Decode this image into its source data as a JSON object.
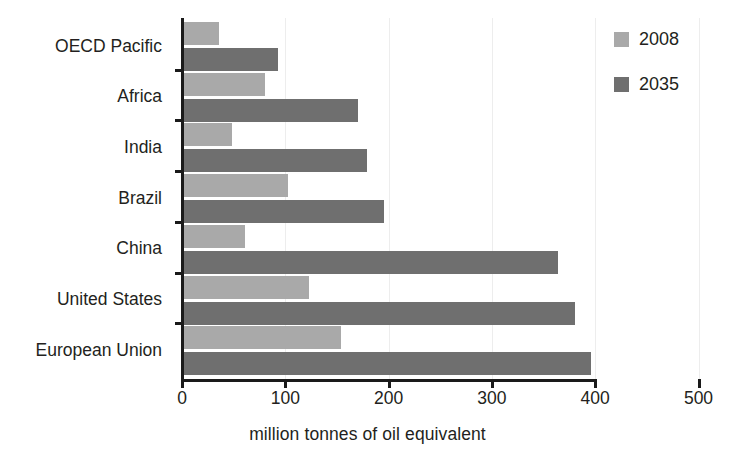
{
  "chart_data": {
    "type": "bar",
    "orientation": "horizontal",
    "title": "",
    "xlabel": "million tonnes of oil equivalent",
    "ylabel": "",
    "xlim": [
      0,
      500
    ],
    "xticks": [
      0,
      100,
      200,
      300,
      400,
      500
    ],
    "xtick_labels": [
      "0",
      "100",
      "200",
      "300",
      "400",
      "500"
    ],
    "grid": true,
    "legend_position": "top-right",
    "categories": [
      "OECD Pacific",
      "Africa",
      "India",
      "Brazil",
      "China",
      "United States",
      "European Union"
    ],
    "series": [
      {
        "name": "2008",
        "color": "#a9a9a9",
        "values": [
          36,
          80,
          48,
          103,
          61,
          123,
          154
        ]
      },
      {
        "name": "2035",
        "color": "#6f6f6f",
        "values": [
          93,
          170,
          179,
          196,
          364,
          380,
          396
        ]
      }
    ]
  },
  "legend": {
    "items": [
      {
        "label": "2008",
        "color": "#a9a9a9"
      },
      {
        "label": "2035",
        "color": "#6f6f6f"
      }
    ]
  },
  "axis": {
    "x_title": "million tonnes of oil equivalent"
  },
  "colors": {
    "series_2008": "#a9a9a9",
    "series_2035": "#6f6f6f",
    "axis": "#1a1a1a",
    "grid": "#ededed",
    "text": "#231f20",
    "background": "#ffffff"
  }
}
